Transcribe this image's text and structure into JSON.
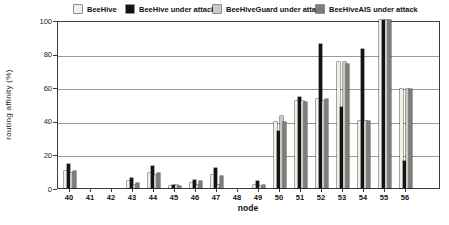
{
  "chart_data": {
    "type": "bar",
    "title": "",
    "xlabel": "node",
    "ylabel": "routing affinity (%)",
    "ylim": [
      0,
      100
    ],
    "yticks": [
      0,
      20,
      40,
      60,
      80,
      100
    ],
    "grid": true,
    "legend_position": "top",
    "categories": [
      "40",
      "41",
      "42",
      "43",
      "44",
      "45",
      "46",
      "47",
      "48",
      "49",
      "50",
      "51",
      "52",
      "53",
      "54",
      "55",
      "56"
    ],
    "series": [
      {
        "name": "BeeHive",
        "color": "#f2f1e6",
        "values": [
          10,
          0,
          0,
          4,
          9,
          1,
          3,
          8,
          0,
          2,
          39,
          52,
          53,
          75,
          40,
          100,
          59
        ]
      },
      {
        "name": "BeeHive under attack",
        "color": "#141414",
        "values": [
          14,
          0,
          0,
          6,
          13,
          2,
          5,
          12,
          0,
          4,
          34,
          54,
          86,
          48,
          83,
          100,
          16
        ]
      },
      {
        "name": "BeeHiveGuard under attack",
        "color": "#c9c9c4",
        "values": [
          9,
          0,
          0,
          2,
          8,
          2,
          2,
          2,
          0,
          1,
          43,
          52,
          52,
          75,
          40,
          100,
          59
        ]
      },
      {
        "name": "BeeHiveAIS under attack",
        "color": "#7d7d7d",
        "values": [
          10,
          0,
          0,
          3,
          9,
          1,
          4,
          7,
          0,
          2,
          39,
          51,
          53,
          74,
          40,
          100,
          59
        ]
      }
    ]
  },
  "layout_text": {
    "ylabel": "routing affinity (%)",
    "xlabel": "node"
  }
}
